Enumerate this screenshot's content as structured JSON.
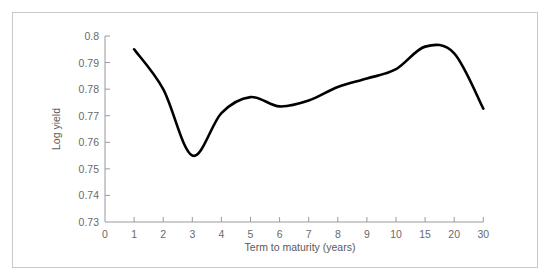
{
  "chart_data": {
    "type": "line",
    "title": "",
    "xlabel": "Term to maturity (years)",
    "ylabel": "Log yield",
    "x_ticks": [
      "0",
      "1",
      "2",
      "3",
      "4",
      "5",
      "6",
      "7",
      "8",
      "9",
      "10",
      "15",
      "20",
      "30"
    ],
    "y_ticks": [
      "0.73",
      "0.74",
      "0.75",
      "0.76",
      "0.77",
      "0.78",
      "0.79",
      "0.8"
    ],
    "ylim": [
      0.73,
      0.8
    ],
    "grid": false,
    "legend": null,
    "series": [
      {
        "name": "Log yield",
        "color": "#000000",
        "x": [
          "1",
          "2",
          "3",
          "4",
          "5",
          "6",
          "7",
          "8",
          "9",
          "10",
          "15",
          "20",
          "30"
        ],
        "values": [
          0.795,
          0.78,
          0.755,
          0.771,
          0.777,
          0.7735,
          0.7757,
          0.7808,
          0.784,
          0.7875,
          0.796,
          0.7935,
          0.7727
        ]
      }
    ]
  },
  "axes": {
    "xlabel": "Term to maturity (years)",
    "ylabel": "Log yield"
  }
}
